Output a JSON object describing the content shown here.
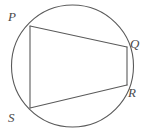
{
  "figure": {
    "background_color": "#ffffff",
    "stroke_color": "#5a5a5a",
    "label_color": "#4a4a4a",
    "circle": {
      "name": "circumscribed-circle",
      "cx": 72.5,
      "cy": 66,
      "r": 61,
      "stroke_width": 1.1
    },
    "vertices": [
      {
        "id": "P",
        "label": "P",
        "x": 30,
        "y": 26,
        "label_x": 8,
        "label_y": 10
      },
      {
        "id": "Q",
        "label": "Q",
        "x": 127,
        "y": 47,
        "label_x": 130,
        "label_y": 37
      },
      {
        "id": "R",
        "label": "R",
        "x": 127,
        "y": 85,
        "label_x": 128,
        "label_y": 86
      },
      {
        "id": "S",
        "label": "S",
        "x": 30,
        "y": 108,
        "label_x": 8,
        "label_y": 111
      }
    ],
    "chords": [
      {
        "id": "PQ",
        "from": "P",
        "to": "Q",
        "x1": 30,
        "y1": 26,
        "x2": 127,
        "y2": 47,
        "stroke_width": 1.1
      },
      {
        "id": "QR",
        "from": "Q",
        "to": "R",
        "x1": 127,
        "y1": 47,
        "x2": 127,
        "y2": 85,
        "stroke_width": 1.1
      },
      {
        "id": "RS",
        "from": "R",
        "to": "S",
        "x1": 127,
        "y1": 85,
        "x2": 30,
        "y2": 108,
        "stroke_width": 1.1
      },
      {
        "id": "SP",
        "from": "S",
        "to": "P",
        "x1": 30,
        "y1": 108,
        "x2": 30,
        "y2": 26,
        "stroke_width": 1.1
      }
    ]
  }
}
